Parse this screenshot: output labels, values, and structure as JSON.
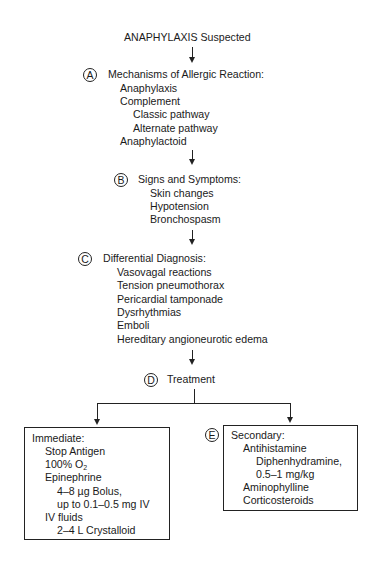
{
  "title": "ANAPHYLAXIS Suspected",
  "steps": {
    "A": {
      "label": "A",
      "heading": "Mechanisms of Allergic Reaction:",
      "items": [
        "Anaphylaxis",
        "Complement",
        "Classic pathway",
        "Alternate pathway",
        "Anaphylactoid"
      ]
    },
    "B": {
      "label": "B",
      "heading": "Signs and Symptoms:",
      "items": [
        "Skin changes",
        "Hypotension",
        "Bronchospasm"
      ]
    },
    "C": {
      "label": "C",
      "heading": "Differential Diagnosis:",
      "items": [
        "Vasovagal reactions",
        "Tension pneumothorax",
        "Pericardial tamponade",
        "Dysrhythmias",
        "Emboli",
        "Hereditary angioneurotic edema"
      ]
    },
    "D": {
      "label": "D",
      "heading": "Treatment"
    },
    "E": {
      "label": "E"
    }
  },
  "immediate": {
    "heading": "Immediate:",
    "items": [
      "Stop Antigen",
      "100% O",
      "2",
      "Epinephrine",
      "4–8 µg Bolus,",
      "up to 0.1–0.5 mg IV",
      "IV fluids",
      "2–4 L Crystalloid"
    ]
  },
  "secondary": {
    "heading": "Secondary:",
    "items": [
      "Antihistamine",
      "Diphenhydramine,",
      "0.5–1 mg/kg",
      "Aminophylline",
      "Corticosteroids"
    ]
  }
}
